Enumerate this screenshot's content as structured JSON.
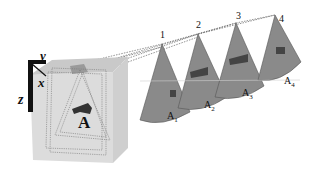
{
  "axes": {
    "x": "x",
    "y": "y",
    "z": "z"
  },
  "volume_label": "A",
  "slices": [
    {
      "number": "1",
      "label": "A",
      "sub": "1"
    },
    {
      "number": "2",
      "label": "A",
      "sub": "2"
    },
    {
      "number": "3",
      "label": "A",
      "sub": "3"
    },
    {
      "number": "4",
      "label": "A",
      "sub": "4"
    }
  ],
  "colors": {
    "cube": "#d9d9d9",
    "cube_top": "#c4c4c4",
    "cone": "#8a8a8a",
    "blob": "#333333"
  }
}
